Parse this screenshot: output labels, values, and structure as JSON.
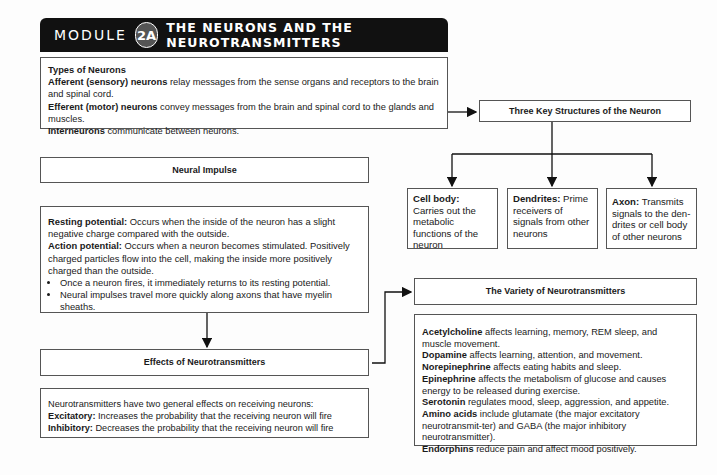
{
  "header": {
    "module_label": "MODULE",
    "module_number": "2A",
    "title": "THE NEURONS AND THE NEUROTRANSMITTERS"
  },
  "types_of_neurons": {
    "heading": "Types of Neurons",
    "items": [
      {
        "term": "Afferent (sensory) neurons",
        "text": " relay messages from the sense organs and receptors to the brain and spinal cord."
      },
      {
        "term": "Efferent (motor) neurons",
        "text": " convey messages from the brain and spinal cord to the glands and muscles."
      },
      {
        "term": "Interneurons",
        "text": " communicate between neurons."
      }
    ]
  },
  "three_key_structures": {
    "title": "Three Key Structures of the Neuron",
    "structures": [
      {
        "term": "Cell body:",
        "text": " Carries out the metabolic functions of the neuron"
      },
      {
        "term": "Dendrites:",
        "text": " Prime receivers of signals from other neurons"
      },
      {
        "term": "Axon:",
        "text": " Transmits signals to the den-drites or cell body of other neurons"
      }
    ]
  },
  "neural_impulse": {
    "title": "Neural Impulse",
    "definitions": [
      {
        "term": "Resting potential:",
        "text": " Occurs when the inside of the neuron has a slight negative charge compared with the outside."
      },
      {
        "term": "Action potential:",
        "text": " Occurs when a neuron becomes stimulated. Positively charged particles flow into the cell, making the inside more positively charged than the outside."
      }
    ],
    "bullets": [
      "Once a neuron fires, it immediately returns to its resting potential.",
      "Neural impulses travel more quickly along axons that have myelin sheaths."
    ]
  },
  "effects_of_neurotransmitters": {
    "title": "Effects of Neurotransmitters",
    "intro": "Neurotransmitters have two general effects on receiving neurons:",
    "items": [
      {
        "term": "Excitatory:",
        "text": " Increases the probability that the receiving neuron will fire"
      },
      {
        "term": "Inhibitory:",
        "text": " Decreases the probability that the receiving neuron will fire"
      }
    ]
  },
  "variety_of_neurotransmitters": {
    "title": "The Variety of Neurotransmitters",
    "items": [
      {
        "term": "Acetylcholine",
        "text": " affects learning, memory, REM sleep, and muscle movement."
      },
      {
        "term": "Dopamine",
        "text": " affects learning, attention, and movement."
      },
      {
        "term": "Norepinephrine",
        "text": " affects eating habits and sleep."
      },
      {
        "term": "Epinephrine",
        "text": " affects the metabolism of glucose and causes energy to be released during exercise."
      },
      {
        "term": "Serotonin",
        "text": " regulates mood, sleep, aggression, and appetite."
      },
      {
        "term": "Amino acids",
        "text": " include glutamate (the major excitatory neurotransmit-ter) and GABA (the major inhibitory neurotransmitter)."
      },
      {
        "term": "Endorphins",
        "text": " reduce pain and affect mood positively."
      }
    ]
  }
}
